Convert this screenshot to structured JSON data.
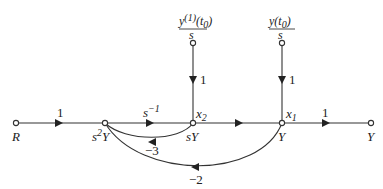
{
  "diagram": {
    "type": "signal-flow-graph",
    "nodes": [
      {
        "id": "R",
        "label": "R"
      },
      {
        "id": "s2Y",
        "label": "s²Y"
      },
      {
        "id": "sY",
        "label": "sY",
        "state": "x₂"
      },
      {
        "id": "Y",
        "label": "Y",
        "state": "x₁"
      },
      {
        "id": "Yout",
        "label": "Y"
      },
      {
        "id": "ic1",
        "label_num": "y⁽¹⁾(t₀)",
        "label_den": "s"
      },
      {
        "id": "ic0",
        "label_num": "y(t₀)",
        "label_den": "s"
      }
    ],
    "edges": [
      {
        "from": "R",
        "to": "s2Y",
        "gain": "1"
      },
      {
        "from": "s2Y",
        "to": "sY",
        "gain": "s⁻¹"
      },
      {
        "from": "sY",
        "to": "Y",
        "gain": ""
      },
      {
        "from": "Y",
        "to": "Yout",
        "gain": "1"
      },
      {
        "from": "ic1",
        "to": "sY",
        "gain": "1"
      },
      {
        "from": "ic0",
        "to": "Y",
        "gain": "1"
      },
      {
        "from": "sY",
        "to": "s2Y",
        "gain": "−3"
      },
      {
        "from": "Y",
        "to": "s2Y",
        "gain": "−2"
      }
    ]
  },
  "labels": {
    "R": "R",
    "s2Y_s": "s",
    "s2Y_2": "2",
    "s2Y_Y": "Y",
    "sY": "sY",
    "Y_mid": "Y",
    "Y_out": "Y",
    "x2": "x",
    "x2_sub": "2",
    "x1": "x",
    "x1_sub": "1",
    "gain_R": "1",
    "gain_sinv": "s",
    "gain_sinv_exp": "−1",
    "gain_out": "1",
    "gain_ic1": "1",
    "gain_ic0": "1",
    "gain_m3": "−3",
    "gain_m2": "−2",
    "ic1_num": "y(1)(t0)",
    "ic1_den": "s",
    "ic0_num": "y(t0)",
    "ic0_den": "s"
  }
}
